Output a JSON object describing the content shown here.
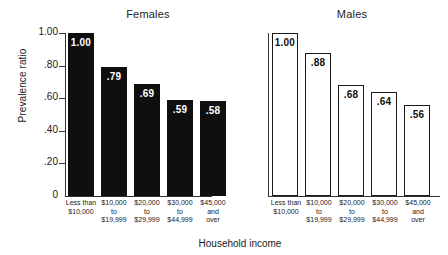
{
  "figure": {
    "xlabel": "Household income",
    "ylabel": "Prevalence ratio"
  },
  "yaxis": {
    "ticks": [
      "1.00",
      ".80",
      ".60",
      ".40",
      ".20",
      "0"
    ],
    "values": [
      1.0,
      0.8,
      0.6,
      0.4,
      0.2,
      0.0
    ]
  },
  "panels": [
    {
      "title": "Females",
      "style": "filled",
      "bars": [
        {
          "label": "Less than\n$10,000",
          "value": 1.0,
          "display": "1.00"
        },
        {
          "label": "$10,000\nto\n$19,999",
          "value": 0.79,
          "display": ".79"
        },
        {
          "label": "$20,000\nto\n$29,999",
          "value": 0.69,
          "display": ".69"
        },
        {
          "label": "$30,000\nto\n$44,999",
          "value": 0.59,
          "display": ".59"
        },
        {
          "label": "$45,000\nand\nover",
          "value": 0.58,
          "display": ".58"
        }
      ]
    },
    {
      "title": "Males",
      "style": "hollow",
      "bars": [
        {
          "label": "Less than\n$10,000",
          "value": 1.0,
          "display": "1.00"
        },
        {
          "label": "$10,000\nto\n$19,999",
          "value": 0.88,
          "display": ".88"
        },
        {
          "label": "$20,000\nto\n$29,999",
          "value": 0.68,
          "display": ".68"
        },
        {
          "label": "$30,000\nto\n$44,999",
          "value": 0.64,
          "display": ".64"
        },
        {
          "label": "$45,000\nand\nover",
          "value": 0.56,
          "display": ".56"
        }
      ]
    }
  ],
  "chart_data": {
    "type": "bar",
    "title": "",
    "xlabel": "Household income",
    "ylabel": "Prevalence ratio",
    "ylim": [
      0,
      1.0
    ],
    "yticks": [
      0,
      0.2,
      0.4,
      0.6,
      0.8,
      1.0
    ],
    "ytick_labels": [
      "0",
      ".20",
      ".40",
      ".60",
      ".80",
      "1.00"
    ],
    "grid": false,
    "legend": "none",
    "panels": [
      "Females",
      "Males"
    ],
    "categories": [
      "Less than $10,000",
      "$10,000 to $19,999",
      "$20,000 to $29,999",
      "$30,000 to $44,999",
      "$45,000 and over"
    ],
    "series": [
      {
        "name": "Females",
        "values": [
          1.0,
          0.79,
          0.69,
          0.59,
          0.58
        ],
        "fill": "#0f0f0f"
      },
      {
        "name": "Males",
        "values": [
          1.0,
          0.88,
          0.68,
          0.64,
          0.56
        ],
        "fill": "#ffffff"
      }
    ],
    "data_labels": [
      [
        "1.00",
        ".79",
        ".69",
        ".59",
        ".58"
      ],
      [
        "1.00",
        ".88",
        ".68",
        ".64",
        ".56"
      ]
    ]
  }
}
